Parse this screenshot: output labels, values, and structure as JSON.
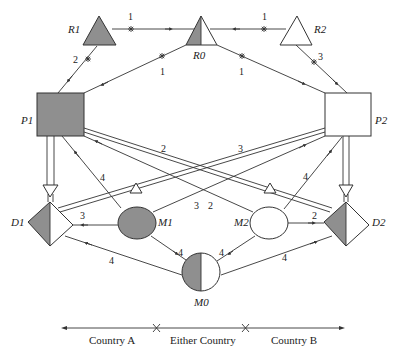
{
  "colors": {
    "fill_dark": "#8f8f8f",
    "fill_light": "#ffffff",
    "stroke": "#333333"
  },
  "nodes": {
    "R1": {
      "label": "R1",
      "shape": "triangle",
      "fill": "gray"
    },
    "R0": {
      "label": "R0",
      "shape": "triangle",
      "fill": "half"
    },
    "R2": {
      "label": "R2",
      "shape": "triangle",
      "fill": "white"
    },
    "P1": {
      "label": "P1",
      "shape": "square",
      "fill": "gray"
    },
    "P2": {
      "label": "P2",
      "shape": "square",
      "fill": "white"
    },
    "D1": {
      "label": "D1",
      "shape": "diamond",
      "fill": "half"
    },
    "D2": {
      "label": "D2",
      "shape": "diamond",
      "fill": "half"
    },
    "M1": {
      "label": "M1",
      "shape": "ellipse",
      "fill": "gray"
    },
    "M2": {
      "label": "M2",
      "shape": "ellipse",
      "fill": "white"
    },
    "M0": {
      "label": "M0",
      "shape": "circle",
      "fill": "half"
    }
  },
  "edges": [
    {
      "from": "R1",
      "to": "R0",
      "label": "1",
      "cut": true
    },
    {
      "from": "R2",
      "to": "R0",
      "label": "1",
      "cut": true
    },
    {
      "from": "R1",
      "to": "P1",
      "label": "2",
      "cut": true
    },
    {
      "from": "R0",
      "to": "P1",
      "label": "1",
      "cut": true
    },
    {
      "from": "R0",
      "to": "P2",
      "label": "1",
      "cut": true
    },
    {
      "from": "R2",
      "to": "P2",
      "label": "3",
      "cut": true
    },
    {
      "from": "P1",
      "to": "D1",
      "label": "",
      "type": "double"
    },
    {
      "from": "P2",
      "to": "D2",
      "label": "",
      "type": "double"
    },
    {
      "from": "P1",
      "to": "D2",
      "label": "2",
      "type": "double"
    },
    {
      "from": "P2",
      "to": "D1",
      "label": "3",
      "type": "double"
    },
    {
      "from": "M1",
      "to": "P1",
      "label": "4"
    },
    {
      "from": "M1",
      "to": "P2",
      "label": "3"
    },
    {
      "from": "M2",
      "to": "P1",
      "label": "2"
    },
    {
      "from": "M2",
      "to": "P2",
      "label": "4"
    },
    {
      "from": "M1",
      "to": "D1",
      "label": "3"
    },
    {
      "from": "M2",
      "to": "D2",
      "label": "2"
    },
    {
      "from": "M1",
      "to": "M0",
      "label": "4"
    },
    {
      "from": "M2",
      "to": "M0",
      "label": "4"
    },
    {
      "from": "M0",
      "to": "D1",
      "label": "4"
    },
    {
      "from": "M0",
      "to": "D2",
      "label": "4"
    }
  ],
  "legend": {
    "left": "Country A",
    "middle": "Either Country",
    "right": "Country B"
  }
}
